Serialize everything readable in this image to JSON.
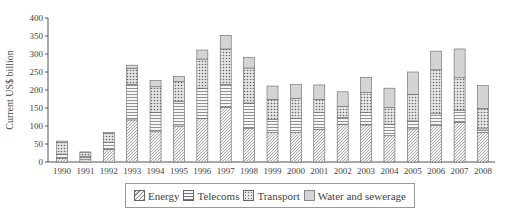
{
  "chart_data": {
    "type": "bar",
    "stacked": true,
    "title": "",
    "xlabel": "",
    "ylabel": "Current US$ billion",
    "ylim": [
      0,
      400
    ],
    "yticks": [
      0,
      50,
      100,
      150,
      200,
      250,
      300,
      350,
      400
    ],
    "grid": false,
    "legend_position": "bottom",
    "categories": [
      "1990",
      "1991",
      "1992",
      "1993",
      "1994",
      "1995",
      "1996",
      "1997",
      "1998",
      "1999",
      "2000",
      "2001",
      "2002",
      "2003",
      "2004",
      "2005",
      "2006",
      "2007",
      "2008"
    ],
    "series": [
      {
        "name": "Energy",
        "pattern": "diagonal-hatch",
        "values": [
          10,
          8,
          35,
          117,
          84,
          100,
          121,
          152,
          94,
          82,
          82,
          91,
          105,
          103,
          73,
          92,
          101,
          110,
          82
        ]
      },
      {
        "name": "Telecoms",
        "pattern": "horizontal-lines",
        "values": [
          12,
          8,
          20,
          99,
          54,
          68,
          84,
          63,
          70,
          36,
          39,
          46,
          18,
          34,
          32,
          22,
          33,
          34,
          10
        ]
      },
      {
        "name": "Transport",
        "pattern": "dots",
        "values": [
          32,
          10,
          24,
          44,
          71,
          55,
          81,
          99,
          97,
          56,
          56,
          37,
          31,
          56,
          46,
          74,
          122,
          90,
          57
        ]
      },
      {
        "name": "Water and sewerage",
        "pattern": "light-gray",
        "values": [
          4,
          2,
          3,
          9,
          17,
          14,
          25,
          38,
          30,
          37,
          38,
          40,
          41,
          42,
          54,
          62,
          52,
          80,
          63
        ]
      }
    ]
  },
  "legend": {
    "items": [
      {
        "label": "Energy",
        "pattern": "energy"
      },
      {
        "label": "Telecoms",
        "pattern": "telecoms"
      },
      {
        "label": "Transport",
        "pattern": "transport"
      },
      {
        "label": "Water and sewerage",
        "pattern": "water"
      }
    ]
  }
}
